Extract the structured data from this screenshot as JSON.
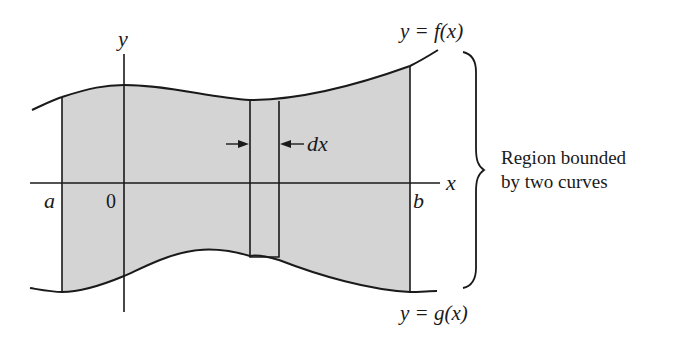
{
  "figure": {
    "colors": {
      "region_fill": "#d4d4d4",
      "stroke": "#1a1a1a",
      "background": "#ffffff"
    },
    "labels": {
      "top_curve": "y = f(x)",
      "bottom_curve": "y = g(x)",
      "y_axis": "y",
      "x_axis": "x",
      "origin": "0",
      "left_bound": "a",
      "right_bound": "b",
      "strip_width": "dx",
      "annotation_line1": "Region bounded",
      "annotation_line2": "by two curves"
    }
  }
}
